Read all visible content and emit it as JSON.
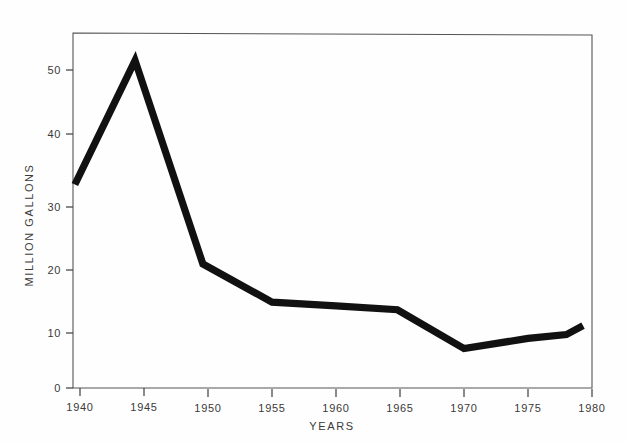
{
  "chart_data": {
    "type": "line",
    "title": "",
    "subtitle": "",
    "xlabel": "YEARS",
    "ylabel": "MILLION GALLONS",
    "xlim": [
      1939,
      1980.5
    ],
    "ylim": [
      0,
      56
    ],
    "grid": false,
    "legend": "none",
    "x_ticks": [
      1940,
      1945,
      1950,
      1955,
      1960,
      1965,
      1970,
      1975,
      1980
    ],
    "x_tick_labels": [
      "1940",
      "1945",
      "1950",
      "1955",
      "1960",
      "1965",
      "1970",
      "1975",
      "1980"
    ],
    "y_ticks": [
      0,
      10,
      20,
      30,
      40,
      50
    ],
    "y_tick_labels": [
      "0",
      "10",
      "20",
      "30",
      "40",
      "50"
    ],
    "series": [
      {
        "name": "Million gallons",
        "color": "#111111",
        "x": [
          1939.6,
          1944.3,
          1949.6,
          1955.0,
          1960.0,
          1964.8,
          1970.0,
          1975.0,
          1978.0,
          1979.3
        ],
        "values": [
          32.0,
          51.5,
          19.5,
          13.5,
          12.9,
          12.3,
          6.2,
          7.8,
          8.4,
          9.8
        ]
      }
    ],
    "annotations": []
  },
  "figure": {
    "background_color": "#fefefe",
    "line_color": "#111111",
    "axis_color": "#555555",
    "text_color": "#3a3a3a"
  }
}
